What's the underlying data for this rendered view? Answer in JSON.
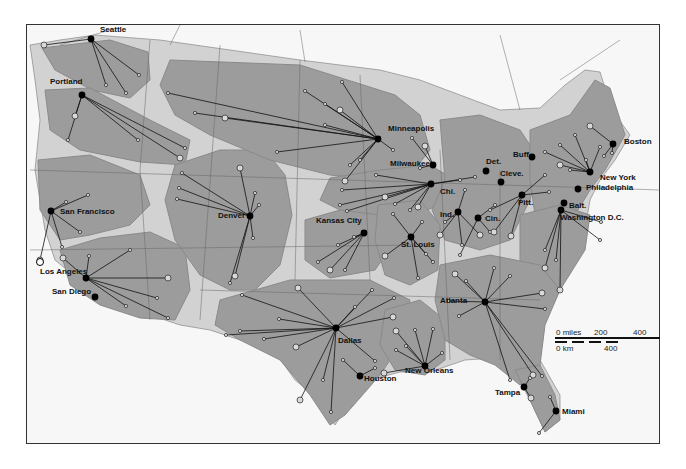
{
  "colors": {
    "background": "#ffffff",
    "land_outside": "#f7f7f7",
    "light_zone": "#d2d2d2",
    "region_fill": "#9c9c9c",
    "region_edge": "#8a8a8a",
    "hub": "#000000",
    "spoke": "#111111",
    "border_line": "#555555"
  },
  "hubs": [
    {
      "name": "Seattle",
      "x": 91,
      "y": 39,
      "lx": 100,
      "ly": 26
    },
    {
      "name": "Portland",
      "x": 82,
      "y": 95,
      "lx": 50,
      "ly": 78
    },
    {
      "name": "San Francisco",
      "x": 51,
      "y": 211,
      "lx": 60,
      "ly": 208
    },
    {
      "name": "Los Angeles",
      "x": 86,
      "y": 278,
      "lx": 40,
      "ly": 268
    },
    {
      "name": "San Diego",
      "x": 95,
      "y": 297,
      "lx": 52,
      "ly": 288
    },
    {
      "name": "Denver",
      "x": 250,
      "y": 216,
      "lx": 218,
      "ly": 212
    },
    {
      "name": "Minneapolis",
      "x": 378,
      "y": 139,
      "lx": 388,
      "ly": 125
    },
    {
      "name": "Milwaukee",
      "x": 433,
      "y": 165,
      "lx": 390,
      "ly": 160
    },
    {
      "name": "Chi.",
      "x": 431,
      "y": 184,
      "lx": 440,
      "ly": 188
    },
    {
      "name": "Det.",
      "x": 486,
      "y": 171,
      "lx": 486,
      "ly": 158
    },
    {
      "name": "Cleve.",
      "x": 501,
      "y": 182,
      "lx": 500,
      "ly": 170
    },
    {
      "name": "Buff.",
      "x": 532,
      "y": 157,
      "lx": 513,
      "ly": 151
    },
    {
      "name": "Boston",
      "x": 613,
      "y": 144,
      "lx": 624,
      "ly": 138
    },
    {
      "name": "New York",
      "x": 590,
      "y": 172,
      "lx": 600,
      "ly": 174
    },
    {
      "name": "Philadelphia",
      "x": 578,
      "y": 189,
      "lx": 586,
      "ly": 184
    },
    {
      "name": "Pitt.",
      "x": 522,
      "y": 195,
      "lx": 518,
      "ly": 199
    },
    {
      "name": "Balt.",
      "x": 564,
      "y": 203,
      "lx": 569,
      "ly": 202
    },
    {
      "name": "Washington D.C.",
      "x": 561,
      "y": 210,
      "lx": 560,
      "ly": 214
    },
    {
      "name": "Ind.",
      "x": 458,
      "y": 212,
      "lx": 440,
      "ly": 211
    },
    {
      "name": "Cin.",
      "x": 478,
      "y": 218,
      "lx": 485,
      "ly": 215
    },
    {
      "name": "Kansas City",
      "x": 364,
      "y": 233,
      "lx": 316,
      "ly": 217
    },
    {
      "name": "St. Louis",
      "x": 411,
      "y": 237,
      "lx": 401,
      "ly": 241
    },
    {
      "name": "Atlanta",
      "x": 485,
      "y": 302,
      "lx": 440,
      "ly": 297
    },
    {
      "name": "Dallas",
      "x": 336,
      "y": 328,
      "lx": 338,
      "ly": 337
    },
    {
      "name": "Houston",
      "x": 360,
      "y": 376,
      "lx": 364,
      "ly": 375
    },
    {
      "name": "New Orleans",
      "x": 425,
      "y": 366,
      "lx": 405,
      "ly": 367
    },
    {
      "name": "Tampa",
      "x": 524,
      "y": 387,
      "lx": 495,
      "ly": 389
    },
    {
      "name": "Miami",
      "x": 556,
      "y": 411,
      "lx": 562,
      "ly": 408
    }
  ],
  "scale_bar": {
    "miles_label": "0 miles",
    "miles_mid": "200",
    "miles_max": "400",
    "km_label": "0 km",
    "km_max": "400"
  },
  "spokes": [
    [
      91,
      39,
      44,
      45
    ],
    [
      91,
      39,
      139,
      75
    ],
    [
      91,
      39,
      106,
      85
    ],
    [
      91,
      39,
      126,
      93
    ],
    [
      82,
      95,
      75,
      116
    ],
    [
      82,
      95,
      68,
      140
    ],
    [
      82,
      95,
      138,
      140
    ],
    [
      82,
      95,
      185,
      148
    ],
    [
      82,
      95,
      180,
      158
    ],
    [
      51,
      211,
      66,
      202
    ],
    [
      51,
      211,
      88,
      195
    ],
    [
      51,
      211,
      80,
      232
    ],
    [
      51,
      211,
      40,
      260
    ],
    [
      51,
      211,
      62,
      247
    ],
    [
      86,
      278,
      89,
      256
    ],
    [
      86,
      278,
      130,
      250
    ],
    [
      86,
      278,
      168,
      278
    ],
    [
      86,
      278,
      157,
      298
    ],
    [
      86,
      278,
      168,
      318
    ],
    [
      86,
      278,
      126,
      306
    ],
    [
      86,
      278,
      63,
      258
    ],
    [
      250,
      216,
      179,
      188
    ],
    [
      250,
      216,
      177,
      199
    ],
    [
      250,
      216,
      182,
      173
    ],
    [
      250,
      216,
      240,
      168
    ],
    [
      250,
      216,
      255,
      193
    ],
    [
      250,
      216,
      259,
      205
    ],
    [
      250,
      216,
      230,
      283
    ],
    [
      250,
      216,
      235,
      276
    ],
    [
      250,
      216,
      253,
      238
    ],
    [
      378,
      139,
      168,
      93
    ],
    [
      378,
      139,
      195,
      113
    ],
    [
      378,
      139,
      225,
      118
    ],
    [
      378,
      139,
      305,
      91
    ],
    [
      378,
      139,
      325,
      104
    ],
    [
      378,
      139,
      342,
      82
    ],
    [
      378,
      139,
      340,
      110
    ],
    [
      378,
      139,
      325,
      125
    ],
    [
      378,
      139,
      277,
      152
    ],
    [
      378,
      139,
      350,
      165
    ],
    [
      378,
      139,
      345,
      181
    ],
    [
      378,
      139,
      393,
      150
    ],
    [
      378,
      139,
      360,
      160
    ],
    [
      433,
      165,
      412,
      138
    ],
    [
      433,
      165,
      425,
      146
    ],
    [
      433,
      165,
      420,
      168
    ],
    [
      431,
      184,
      342,
      190
    ],
    [
      431,
      184,
      376,
      175
    ],
    [
      431,
      184,
      385,
      197
    ],
    [
      431,
      184,
      347,
      211
    ],
    [
      431,
      184,
      340,
      205
    ],
    [
      431,
      184,
      395,
      204
    ],
    [
      431,
      184,
      418,
      207
    ],
    [
      431,
      184,
      410,
      210
    ],
    [
      431,
      184,
      460,
      180
    ],
    [
      431,
      184,
      475,
      177
    ],
    [
      458,
      212,
      440,
      235
    ],
    [
      458,
      212,
      462,
      245
    ],
    [
      458,
      212,
      465,
      190
    ],
    [
      458,
      212,
      445,
      222
    ],
    [
      458,
      212,
      480,
      235
    ],
    [
      478,
      218,
      460,
      255
    ],
    [
      478,
      218,
      490,
      232
    ],
    [
      478,
      218,
      495,
      205
    ],
    [
      522,
      195,
      511,
      236
    ],
    [
      522,
      195,
      490,
      210
    ],
    [
      522,
      195,
      545,
      175
    ],
    [
      522,
      195,
      549,
      192
    ],
    [
      522,
      195,
      494,
      232
    ],
    [
      590,
      172,
      560,
      145
    ],
    [
      590,
      172,
      575,
      135
    ],
    [
      590,
      172,
      545,
      152
    ],
    [
      590,
      172,
      560,
      165
    ],
    [
      590,
      172,
      586,
      160
    ],
    [
      590,
      172,
      600,
      147
    ],
    [
      590,
      172,
      570,
      170
    ],
    [
      613,
      144,
      590,
      126
    ],
    [
      613,
      144,
      604,
      156
    ],
    [
      613,
      144,
      612,
      153
    ],
    [
      561,
      210,
      545,
      250
    ],
    [
      561,
      210,
      545,
      268
    ],
    [
      561,
      210,
      556,
      260
    ],
    [
      561,
      210,
      601,
      222
    ],
    [
      561,
      210,
      600,
      240
    ],
    [
      561,
      210,
      560,
      290
    ],
    [
      364,
      233,
      318,
      262
    ],
    [
      364,
      233,
      338,
      245
    ],
    [
      364,
      233,
      354,
      237
    ],
    [
      364,
      233,
      330,
      270
    ],
    [
      364,
      233,
      345,
      270
    ],
    [
      411,
      237,
      393,
      214
    ],
    [
      411,
      237,
      422,
      222
    ],
    [
      411,
      237,
      385,
      256
    ],
    [
      411,
      237,
      418,
      278
    ],
    [
      411,
      237,
      433,
      262
    ],
    [
      411,
      237,
      426,
      254
    ],
    [
      485,
      302,
      455,
      274
    ],
    [
      485,
      302,
      466,
      281
    ],
    [
      485,
      302,
      494,
      268
    ],
    [
      485,
      302,
      510,
      276
    ],
    [
      485,
      302,
      542,
      293
    ],
    [
      485,
      302,
      545,
      309
    ],
    [
      485,
      302,
      449,
      301
    ],
    [
      485,
      302,
      459,
      316
    ],
    [
      485,
      302,
      533,
      375
    ],
    [
      485,
      302,
      542,
      376
    ],
    [
      485,
      302,
      510,
      380
    ],
    [
      336,
      328,
      242,
      295
    ],
    [
      336,
      328,
      298,
      288
    ],
    [
      336,
      328,
      279,
      319
    ],
    [
      336,
      328,
      226,
      335
    ],
    [
      336,
      328,
      264,
      339
    ],
    [
      336,
      328,
      296,
      347
    ],
    [
      336,
      328,
      355,
      307
    ],
    [
      336,
      328,
      372,
      290
    ],
    [
      336,
      328,
      394,
      298
    ],
    [
      336,
      328,
      393,
      317
    ],
    [
      336,
      328,
      375,
      361
    ],
    [
      336,
      328,
      323,
      380
    ],
    [
      336,
      328,
      331,
      412
    ],
    [
      336,
      328,
      300,
      400
    ],
    [
      336,
      328,
      240,
      331
    ],
    [
      360,
      376,
      343,
      360
    ],
    [
      360,
      376,
      375,
      368
    ],
    [
      425,
      366,
      396,
      331
    ],
    [
      425,
      366,
      396,
      350
    ],
    [
      425,
      366,
      406,
      346
    ],
    [
      425,
      366,
      433,
      329
    ],
    [
      425,
      366,
      384,
      373
    ],
    [
      425,
      366,
      442,
      353
    ],
    [
      425,
      366,
      415,
      330
    ],
    [
      524,
      387,
      530,
      378
    ],
    [
      524,
      387,
      531,
      398
    ],
    [
      556,
      411,
      550,
      397
    ],
    [
      556,
      411,
      539,
      433
    ]
  ]
}
